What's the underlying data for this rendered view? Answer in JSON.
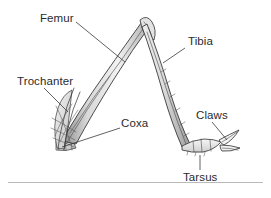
{
  "figure": {
    "background_color": "#ffffff",
    "ink_color": "#2e2e2e",
    "label_color": "#2b2b2b",
    "rule_color": "#b9b9b9",
    "width": 271,
    "height": 198
  },
  "labels": {
    "femur": "Femur",
    "tibia": "Tibia",
    "trochanter": "Trochanter",
    "coxa": "Coxa",
    "claws": "Claws",
    "tarsus": "Tarsus"
  }
}
